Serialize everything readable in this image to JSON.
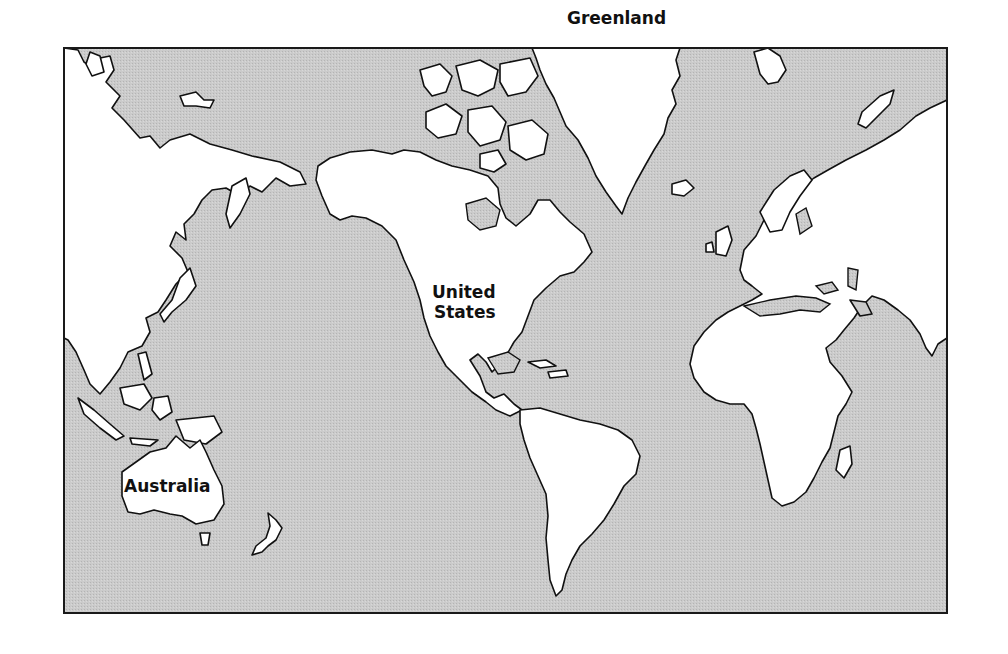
{
  "map": {
    "projection": "Mercator-style world map centered on Pacific/Americas",
    "colors": {
      "ocean": "#c9c9c9",
      "land": "#ffffff",
      "grid": "#2a2a2a",
      "border": "#1a1a1a",
      "coast": "#111111"
    },
    "frame": {
      "left": 64,
      "top": 48,
      "right": 947,
      "bottom": 613
    },
    "grid_x": [
      64,
      103,
      139,
      177,
      213,
      251,
      289,
      323,
      360,
      397,
      434,
      471,
      508,
      545,
      582,
      619,
      655,
      692,
      729,
      766,
      803,
      841,
      876,
      911,
      947
    ],
    "grid_y": [
      48,
      112,
      222,
      288,
      335,
      376,
      415,
      457,
      499,
      549,
      613
    ],
    "longitude_labels_top": [
      {
        "text": "120°E",
        "x": 154
      },
      {
        "text": "180°",
        "x": 292
      },
      {
        "text": "120°W",
        "x": 440
      },
      {
        "text": "60°W",
        "x": 577
      },
      {
        "text": "0°",
        "x": 730
      },
      {
        "text": "60°E",
        "x": 877
      }
    ],
    "longitude_labels_bottom": [
      {
        "text": "120°E",
        "x": 147
      },
      {
        "text": "180°",
        "x": 290
      },
      {
        "text": "120°W",
        "x": 438
      },
      {
        "text": "60°W",
        "x": 585
      },
      {
        "text": "0°",
        "x": 738
      },
      {
        "text": "60°E",
        "x": 884
      }
    ],
    "latitude_labels_left": [
      {
        "text": "75°N",
        "y": 115
      },
      {
        "text": "60°N",
        "y": 220
      },
      {
        "text": "30°N",
        "y": 335
      },
      {
        "text": "0°",
        "y": 414
      },
      {
        "text": "30°S",
        "y": 499
      }
    ],
    "latitude_labels_right": [
      {
        "text": "75°N",
        "y": 113
      },
      {
        "text": "60°N",
        "y": 219
      },
      {
        "text": "30°N",
        "y": 333
      },
      {
        "text": "0°",
        "y": 412
      },
      {
        "text": "30°S",
        "y": 497
      }
    ],
    "place_labels": {
      "greenland": "Greenland",
      "united_states_line1": "United",
      "united_states_line2": "States",
      "australia": "Australia"
    }
  }
}
